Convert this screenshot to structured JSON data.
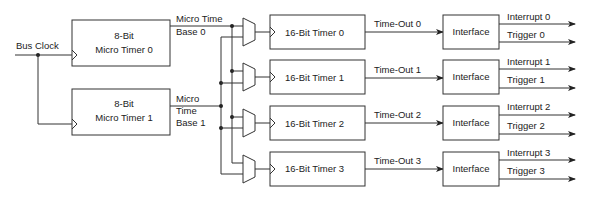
{
  "diagram": {
    "input": {
      "label": "Bus Clock"
    },
    "micro_timers": [
      {
        "line1": "8-Bit",
        "line2": "Micro Timer 0",
        "out_label_1": "Micro Time",
        "out_label_2": "Base 0"
      },
      {
        "line1": "8-Bit",
        "line2": "Micro Timer 1",
        "out_label_1": "Micro",
        "out_label_2": "Time",
        "out_label_3": "Base 1"
      }
    ],
    "timers": [
      {
        "label": "16-Bit Timer 0",
        "timeout": "Time-Out 0",
        "interface": "Interface",
        "interrupt": "Interrupt 0",
        "trigger": "Trigger 0"
      },
      {
        "label": "16-Bit Timer 1",
        "timeout": "Time-Out 1",
        "interface": "Interface",
        "interrupt": "Interrupt 1",
        "trigger": "Trigger 1"
      },
      {
        "label": "16-Bit Timer 2",
        "timeout": "Time-Out 2",
        "interface": "Interface",
        "interrupt": "Interrupt 2",
        "trigger": "Trigger 2"
      },
      {
        "label": "16-Bit Timer 3",
        "timeout": "Time-Out 3",
        "interface": "Interface",
        "interrupt": "Interrupt 3",
        "trigger": "Trigger 3"
      }
    ]
  }
}
